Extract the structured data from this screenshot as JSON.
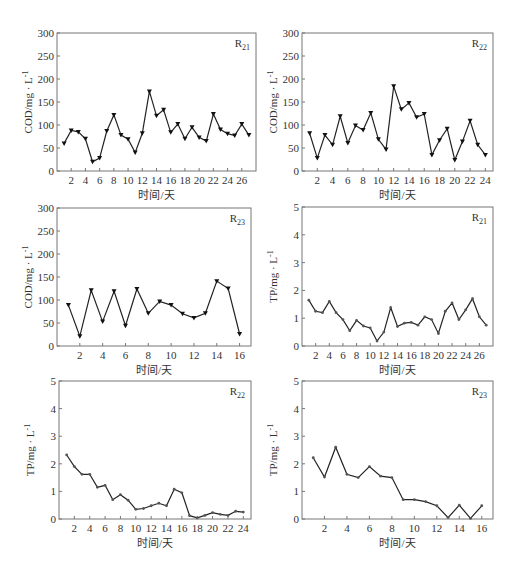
{
  "chart_data": [
    {
      "id": "cod_r21",
      "type": "line",
      "label": "R21",
      "label_main": "R",
      "label_sub": "21",
      "xlabel": "时间/天",
      "ylabel": "COD/mg·L⁻¹",
      "ylabel_main": "COD/mg · L",
      "ylabel_sup": "-1",
      "ylim": [
        0,
        300
      ],
      "yticks": [
        0,
        50,
        100,
        150,
        200,
        250,
        300
      ],
      "xlim": [
        0,
        28
      ],
      "xticks": [
        2,
        4,
        6,
        8,
        10,
        12,
        14,
        16,
        18,
        20,
        22,
        24,
        26
      ],
      "marker": "triangle-down",
      "grid": false,
      "x": [
        1,
        2,
        3,
        4,
        5,
        6,
        7,
        8,
        9,
        10,
        11,
        12,
        13,
        14,
        15,
        16,
        17,
        18,
        19,
        20,
        21,
        22,
        23,
        24,
        25,
        26,
        27
      ],
      "values": [
        60,
        88,
        85,
        70,
        20,
        28,
        87,
        122,
        78,
        69,
        40,
        82,
        173,
        120,
        133,
        84,
        102,
        70,
        95,
        73,
        65,
        124,
        90,
        81,
        77,
        102,
        78
      ],
      "plot_box": {
        "left": 57,
        "top": 33,
        "right": 256,
        "bottom": 171
      }
    },
    {
      "id": "cod_r22",
      "type": "line",
      "label": "R22",
      "label_main": "R",
      "label_sub": "22",
      "xlabel": "时间/天",
      "ylabel": "COD/mg·L⁻¹",
      "ylabel_main": "COD/mg · L",
      "ylabel_sup": "-1",
      "ylim": [
        0,
        300
      ],
      "yticks": [
        0,
        50,
        100,
        150,
        200,
        250,
        300
      ],
      "xlim": [
        0,
        25
      ],
      "xticks": [
        2,
        4,
        6,
        8,
        10,
        12,
        14,
        16,
        18,
        20,
        22,
        24
      ],
      "marker": "triangle-down",
      "grid": false,
      "x": [
        1,
        2,
        3,
        4,
        5,
        6,
        7,
        8,
        9,
        10,
        11,
        12,
        13,
        14,
        15,
        16,
        17,
        18,
        19,
        20,
        21,
        22,
        23,
        24
      ],
      "values": [
        82,
        28,
        78,
        57,
        119,
        61,
        99,
        89,
        126,
        69,
        47,
        184,
        134,
        148,
        117,
        124,
        35,
        67,
        92,
        24,
        64,
        109,
        57,
        35
      ],
      "plot_box": {
        "left": 302,
        "top": 33,
        "right": 493,
        "bottom": 171
      }
    },
    {
      "id": "cod_r23",
      "type": "line",
      "label": "R23",
      "label_main": "R",
      "label_sub": "23",
      "xlabel": "时间/天",
      "ylabel": "COD/mg·L⁻¹",
      "ylabel_main": "COD/mg · L",
      "ylabel_sup": "-1",
      "ylim": [
        0,
        300
      ],
      "yticks": [
        0,
        50,
        100,
        150,
        200,
        250,
        300
      ],
      "xlim": [
        0,
        17
      ],
      "xticks": [
        2,
        4,
        6,
        8,
        10,
        12,
        14,
        16
      ],
      "marker": "triangle-down",
      "grid": false,
      "x": [
        1,
        2,
        3,
        4,
        5,
        6,
        7,
        8,
        9,
        10,
        11,
        12,
        13,
        14,
        15,
        16
      ],
      "values": [
        89,
        21,
        121,
        53,
        119,
        44,
        124,
        71,
        97,
        89,
        70,
        61,
        71,
        141,
        125,
        26
      ],
      "plot_box": {
        "left": 57,
        "top": 208,
        "right": 251,
        "bottom": 346
      }
    },
    {
      "id": "tp_r21",
      "type": "line",
      "label": "R21",
      "label_main": "R",
      "label_sub": "21",
      "xlabel": "时间/天",
      "ylabel": "TP/mg·L⁻¹",
      "ylabel_main": "TP/mg · L",
      "ylabel_sup": "-1",
      "ylim": [
        0,
        5
      ],
      "yticks": [
        0,
        1,
        2,
        3,
        4,
        5
      ],
      "xlim": [
        0,
        28
      ],
      "xticks": [
        2,
        4,
        6,
        8,
        10,
        12,
        14,
        16,
        18,
        20,
        22,
        24,
        26
      ],
      "marker": "dot",
      "grid": false,
      "x": [
        1,
        2,
        3,
        4,
        5,
        6,
        7,
        8,
        9,
        10,
        11,
        12,
        13,
        14,
        15,
        16,
        17,
        18,
        19,
        20,
        21,
        22,
        23,
        24,
        25,
        26,
        27
      ],
      "values": [
        1.65,
        1.25,
        1.2,
        1.6,
        1.2,
        0.95,
        0.55,
        0.92,
        0.72,
        0.65,
        0.18,
        0.5,
        1.38,
        0.7,
        0.82,
        0.85,
        0.75,
        1.05,
        0.95,
        0.45,
        1.25,
        1.55,
        0.95,
        1.3,
        1.7,
        1.05,
        0.75
      ],
      "plot_box": {
        "left": 302,
        "top": 207,
        "right": 493,
        "bottom": 346
      }
    },
    {
      "id": "tp_r22",
      "type": "line",
      "label": "R22",
      "label_main": "R",
      "label_sub": "22",
      "xlabel": "时间/天",
      "ylabel": "TP/mg·L⁻¹",
      "ylabel_main": "TP/mg · L",
      "ylabel_sup": "-1",
      "ylim": [
        0,
        5
      ],
      "yticks": [
        0,
        1,
        2,
        3,
        4,
        5
      ],
      "xlim": [
        0,
        25
      ],
      "xticks": [
        2,
        4,
        6,
        8,
        10,
        12,
        14,
        16,
        18,
        20,
        22,
        24
      ],
      "marker": "dot",
      "grid": false,
      "x": [
        1,
        2,
        3,
        4,
        5,
        6,
        7,
        8,
        9,
        10,
        11,
        12,
        13,
        14,
        15,
        16,
        17,
        18,
        19,
        20,
        21,
        22,
        23,
        24
      ],
      "values": [
        2.32,
        1.9,
        1.62,
        1.62,
        1.15,
        1.22,
        0.7,
        0.88,
        0.68,
        0.35,
        0.38,
        0.48,
        0.57,
        0.48,
        1.08,
        0.95,
        0.12,
        0.04,
        0.13,
        0.23,
        0.17,
        0.13,
        0.28,
        0.25
      ],
      "plot_box": {
        "left": 59,
        "top": 381,
        "right": 251,
        "bottom": 519
      }
    },
    {
      "id": "tp_r23",
      "type": "line",
      "label": "R23",
      "label_main": "R",
      "label_sub": "23",
      "xlabel": "时间/天",
      "ylabel": "TP/mg·L⁻¹",
      "ylabel_main": "TP/mg · L",
      "ylabel_sup": "-1",
      "ylim": [
        0,
        5
      ],
      "yticks": [
        0,
        1,
        2,
        3,
        4,
        5
      ],
      "xlim": [
        0,
        17
      ],
      "xticks": [
        2,
        4,
        6,
        8,
        10,
        12,
        14,
        16
      ],
      "marker": "dot",
      "grid": false,
      "x": [
        1,
        2,
        3,
        4,
        5,
        6,
        7,
        8,
        9,
        10,
        11,
        12,
        13,
        14,
        15,
        16
      ],
      "values": [
        2.22,
        1.52,
        2.6,
        1.62,
        1.5,
        1.9,
        1.55,
        1.5,
        0.7,
        0.7,
        0.63,
        0.48,
        0.05,
        0.5,
        0.02,
        0.48
      ],
      "plot_box": {
        "left": 302,
        "top": 381,
        "right": 493,
        "bottom": 519
      }
    }
  ]
}
